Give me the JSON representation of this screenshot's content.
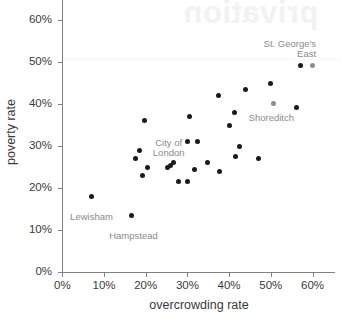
{
  "chart_data": {
    "type": "scatter",
    "title": "",
    "xlabel": "overcrowding rate",
    "ylabel": "poverty rate",
    "xlim": [
      0,
      65
    ],
    "ylim": [
      0,
      65
    ],
    "xticks": [
      "0%",
      "10%",
      "20%",
      "30%",
      "40%",
      "50%",
      "60%"
    ],
    "xtick_values": [
      0,
      10,
      20,
      30,
      40,
      50,
      60
    ],
    "yticks": [
      "0%",
      "10%",
      "20%",
      "30%",
      "40%",
      "50%",
      "60%"
    ],
    "ytick_values": [
      0,
      10,
      20,
      30,
      40,
      50,
      60
    ],
    "grid": false,
    "legend": null,
    "point_color": "#1a1a1a",
    "highlight_color": "#8c8c8c",
    "axis_color": "#808080",
    "text_color": "#3a3a3a",
    "annotation_color": "#8a8a8a",
    "points": [
      {
        "x": 7.0,
        "y": 18.0,
        "label": "Lewisham",
        "highlight": false
      },
      {
        "x": 16.6,
        "y": 13.5,
        "label": "Hampstead",
        "highlight": false
      },
      {
        "x": 17.6,
        "y": 27.0,
        "label": null,
        "highlight": false
      },
      {
        "x": 18.4,
        "y": 29.0,
        "label": null,
        "highlight": false
      },
      {
        "x": 19.6,
        "y": 36.0,
        "label": null,
        "highlight": false
      },
      {
        "x": 19.3,
        "y": 23.0,
        "label": null,
        "highlight": false
      },
      {
        "x": 20.5,
        "y": 25.0,
        "label": null,
        "highlight": false
      },
      {
        "x": 25.3,
        "y": 25.0,
        "label": null,
        "highlight": false
      },
      {
        "x": 26.0,
        "y": 25.3,
        "label": "City of\nLondon",
        "highlight": false
      },
      {
        "x": 26.6,
        "y": 26.0,
        "label": null,
        "highlight": false
      },
      {
        "x": 27.9,
        "y": 21.5,
        "label": null,
        "highlight": false
      },
      {
        "x": 29.9,
        "y": 21.5,
        "label": null,
        "highlight": false
      },
      {
        "x": 30.1,
        "y": 31.0,
        "label": null,
        "highlight": false
      },
      {
        "x": 30.6,
        "y": 37.0,
        "label": null,
        "highlight": false
      },
      {
        "x": 32.3,
        "y": 31.0,
        "label": null,
        "highlight": false
      },
      {
        "x": 31.8,
        "y": 24.5,
        "label": null,
        "highlight": false
      },
      {
        "x": 34.9,
        "y": 26.0,
        "label": null,
        "highlight": false
      },
      {
        "x": 37.4,
        "y": 42.0,
        "label": null,
        "highlight": false
      },
      {
        "x": 37.6,
        "y": 24.0,
        "label": null,
        "highlight": false
      },
      {
        "x": 40.2,
        "y": 35.0,
        "label": null,
        "highlight": false
      },
      {
        "x": 41.2,
        "y": 38.0,
        "label": null,
        "highlight": false
      },
      {
        "x": 41.6,
        "y": 27.5,
        "label": null,
        "highlight": false
      },
      {
        "x": 42.4,
        "y": 30.0,
        "label": null,
        "highlight": false
      },
      {
        "x": 44.0,
        "y": 43.5,
        "label": null,
        "highlight": false
      },
      {
        "x": 47.0,
        "y": 27.0,
        "label": null,
        "highlight": false
      },
      {
        "x": 49.8,
        "y": 45.0,
        "label": null,
        "highlight": false
      },
      {
        "x": 50.6,
        "y": 40.2,
        "label": "Shoreditch",
        "highlight": true
      },
      {
        "x": 56.2,
        "y": 39.2,
        "label": null,
        "highlight": false
      },
      {
        "x": 57.0,
        "y": 49.2,
        "label": null,
        "highlight": false
      },
      {
        "x": 59.9,
        "y": 49.2,
        "label": "St. George's\nEast",
        "highlight": true
      }
    ],
    "annotations": [
      {
        "text": "Lewisham",
        "x": 7.0,
        "y": 18.0,
        "align": "center",
        "dx": 0,
        "dy": 16
      },
      {
        "text": "Hampstead",
        "x": 16.6,
        "y": 13.5,
        "align": "center",
        "dx": 2,
        "dy": 16
      },
      {
        "text": "City of\nLondon",
        "x": 26.0,
        "y": 25.3,
        "align": "center",
        "dx": -2,
        "dy": -28
      },
      {
        "text": "Shoreditch",
        "x": 50.6,
        "y": 40.2,
        "align": "center",
        "dx": -2,
        "dy": 10
      },
      {
        "text": "St. George's\nEast",
        "x": 59.9,
        "y": 49.2,
        "align": "right",
        "dx": 4,
        "dy": -26
      }
    ],
    "watermark": "privation"
  }
}
